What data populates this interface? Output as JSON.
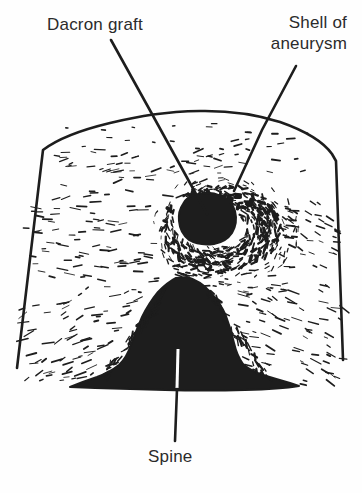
{
  "figure": {
    "labels": {
      "dacron_graft": "Dacron graft",
      "shell_of_aneurysm_line1": "Shell of",
      "shell_of_aneurysm_line2": "aneurysm",
      "spine": "Spine"
    },
    "colors": {
      "ink": "#1d1d1d",
      "paper": "#fefefe",
      "label_text": "#2b2b2b"
    }
  }
}
